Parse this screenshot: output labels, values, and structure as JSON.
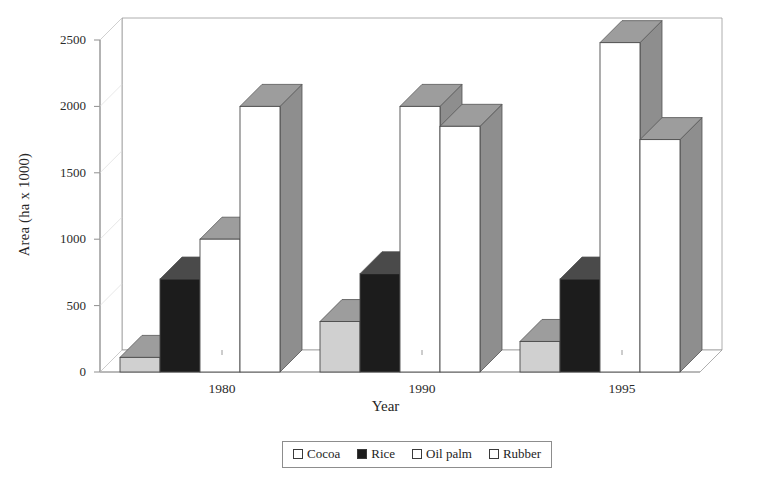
{
  "chart_data": {
    "type": "bar",
    "title": "",
    "xlabel": "Year",
    "ylabel": "Area (ha x 1000)",
    "categories": [
      "1980",
      "1990",
      "1995"
    ],
    "series": [
      {
        "name": "Cocoa",
        "values": [
          110,
          380,
          230
        ],
        "swatch": "#ffffff",
        "face": "#d0d0d0"
      },
      {
        "name": "Rice",
        "values": [
          700,
          740,
          700
        ],
        "swatch": "#1c1c1c",
        "face": "#1c1c1c"
      },
      {
        "name": "Oil palm",
        "values": [
          1000,
          2000,
          2480
        ],
        "swatch": "#ffffff",
        "face": "#ffffff"
      },
      {
        "name": "Rubber",
        "values": [
          2000,
          1850,
          1750
        ],
        "swatch": "#ffffff",
        "face": "#ffffff"
      }
    ],
    "ylim": [
      0,
      2500
    ],
    "yticks": [
      0,
      500,
      1000,
      1500,
      2000,
      2500
    ],
    "ytick_labels": [
      "0",
      "500",
      "1000",
      "1500",
      "2000",
      "2500"
    ],
    "grid": false,
    "legend_position": "bottom",
    "style": "3d-bar-grayscale"
  },
  "legend": {
    "items": [
      {
        "label": "Cocoa"
      },
      {
        "label": "Rice"
      },
      {
        "label": "Oil palm"
      },
      {
        "label": "Rubber"
      }
    ]
  },
  "axes": {
    "y_title": "Area (ha x 1000)",
    "x_title": "Year"
  }
}
